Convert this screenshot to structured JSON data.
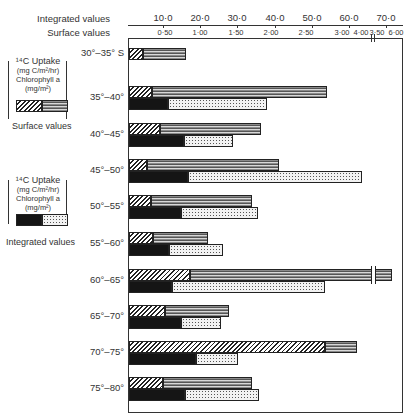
{
  "chart_data": {
    "type": "bar",
    "orientation": "horizontal",
    "title": "",
    "axes": {
      "integrated": {
        "label": "Integrated values",
        "ticks": [
          "10·0",
          "20·0",
          "30·0",
          "40·0",
          "50·0",
          "60·0",
          "70·0"
        ],
        "tick_px": [
          163,
          200,
          237,
          275,
          312,
          349,
          386
        ]
      },
      "surface": {
        "label": "Surface values",
        "ticks": [
          "0·50",
          "1·00",
          "1·50",
          "2·00",
          "2·50",
          "3·00",
          "3·50",
          "4·00",
          "6·00"
        ],
        "tick_px": [
          165,
          200,
          236,
          271,
          306,
          342,
          377,
          372,
          396
        ],
        "break_note": "axis broken between 4·00 and 6·00"
      }
    },
    "categories": [
      "30°–35° S",
      "35°–40°",
      "40°–45°",
      "45°–50°",
      "50°–55°",
      "55°–60°",
      "60°–65°",
      "65°–70°",
      "70°–75°",
      "75°–80°"
    ],
    "series": [
      {
        "name": "Surface 14C Uptake (mg C/m²/hr)",
        "pattern": "lined",
        "values": [
          0.8,
          2.79,
          1.85,
          2.1,
          1.73,
          1.11,
          5.9,
          1.41,
          3.21,
          1.73
        ]
      },
      {
        "name": "Surface Chlorophyll a (mg/m²)",
        "pattern": "hatched",
        "values": [
          0.2,
          0.32,
          0.44,
          0.25,
          0.31,
          0.34,
          0.86,
          0.51,
          2.76,
          0.48
        ]
      },
      {
        "name": "Integrated 14C Uptake (mg C/m²/hr)",
        "pattern": "dotted",
        "values": [
          null,
          38.0,
          29.0,
          63.0,
          35.0,
          26.0,
          53.0,
          25.5,
          30.5,
          35.5
        ]
      },
      {
        "name": "Integrated Chlorophyll a (mg/m²)",
        "pattern": "black",
        "values": [
          null,
          11.0,
          15.5,
          16.5,
          15.0,
          11.5,
          12.5,
          15.0,
          19.0,
          16.0
        ]
      }
    ],
    "xlabel": "",
    "ylabel": "",
    "grid": false,
    "legend_position": "left"
  },
  "labels": {
    "integrated_axis": "Integrated values",
    "surface_axis": "Surface values",
    "legend_surface_title": "Surface values",
    "legend_integrated_title": "Integrated values",
    "legend_uptake": "¹⁴C Uptake",
    "legend_uptake_units": "(mg C/m²/hr)",
    "legend_chl": "Chlorophyll a",
    "legend_chl_units": "(mg/m²)"
  },
  "rows": [
    {
      "label": "30°–35° S",
      "y": 48,
      "hatch": [
        129,
        143
      ],
      "lined": [
        143,
        186
      ],
      "black": null,
      "dotted": null
    },
    {
      "label": "35°–40°",
      "y": 86,
      "hatch": [
        129,
        152
      ],
      "lined": [
        152,
        327
      ],
      "black": [
        129,
        168
      ],
      "dotted": [
        168,
        267
      ]
    },
    {
      "label": "40°–45°",
      "y": 123,
      "hatch": [
        129,
        160
      ],
      "lined": [
        160,
        261
      ],
      "black": [
        129,
        184
      ],
      "dotted": [
        184,
        233
      ]
    },
    {
      "label": "45°–50°",
      "y": 159,
      "hatch": [
        129,
        147
      ],
      "lined": [
        147,
        279
      ],
      "black": [
        129,
        188
      ],
      "dotted": [
        188,
        362
      ]
    },
    {
      "label": "50°–55°",
      "y": 195,
      "hatch": [
        129,
        151
      ],
      "lined": [
        151,
        252
      ],
      "black": [
        129,
        181
      ],
      "dotted": [
        181,
        258
      ]
    },
    {
      "label": "55°–60°",
      "y": 232,
      "hatch": [
        129,
        153
      ],
      "lined": [
        153,
        208
      ],
      "black": [
        129,
        169
      ],
      "dotted": [
        169,
        223
      ]
    },
    {
      "label": "60°–65°",
      "y": 269,
      "hatch": [
        129,
        190
      ],
      "lined": [
        190,
        392
      ],
      "black": [
        129,
        172
      ],
      "dotted": [
        172,
        325
      ],
      "break": 372
    },
    {
      "label": "65°–70°",
      "y": 305,
      "hatch": [
        129,
        165
      ],
      "lined": [
        165,
        229
      ],
      "black": [
        129,
        181
      ],
      "dotted": [
        181,
        221
      ]
    },
    {
      "label": "70°–75°",
      "y": 341,
      "hatch": [
        129,
        325
      ],
      "lined": [
        325,
        357
      ],
      "black": [
        129,
        196
      ],
      "dotted": [
        196,
        238
      ]
    },
    {
      "label": "75°–80°",
      "y": 377,
      "hatch": [
        129,
        163
      ],
      "lined": [
        163,
        252
      ],
      "black": [
        129,
        185
      ],
      "dotted": [
        185,
        259
      ]
    }
  ]
}
